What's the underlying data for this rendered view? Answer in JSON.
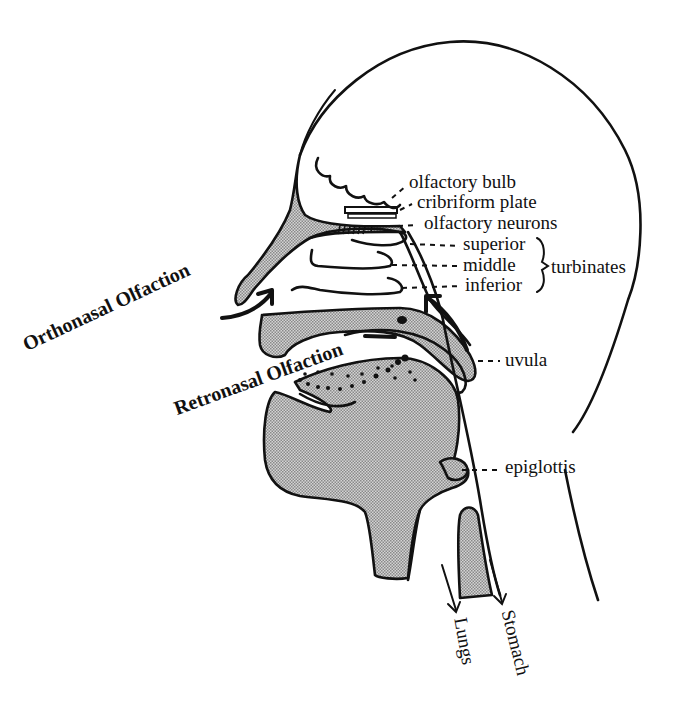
{
  "figure": {
    "type": "anatomical-diagram",
    "colors": {
      "line": "#111111",
      "shade": "#b0b0b0",
      "background": "#ffffff"
    }
  },
  "labels": {
    "olfactory_bulb": "olfactory bulb",
    "cribriform_plate": "cribriform plate",
    "olfactory_neurons": "olfactory neurons",
    "superior": "superior",
    "middle": "middle",
    "inferior": "inferior",
    "turbinates": "turbinates",
    "uvula": "uvula",
    "epiglottis": "epiglottis",
    "lungs": "Lungs",
    "stomach": "Stomach"
  },
  "pathways": {
    "orthonasal": "Orthonasal Olfaction",
    "retronasal": "Retronasal Olfaction"
  }
}
